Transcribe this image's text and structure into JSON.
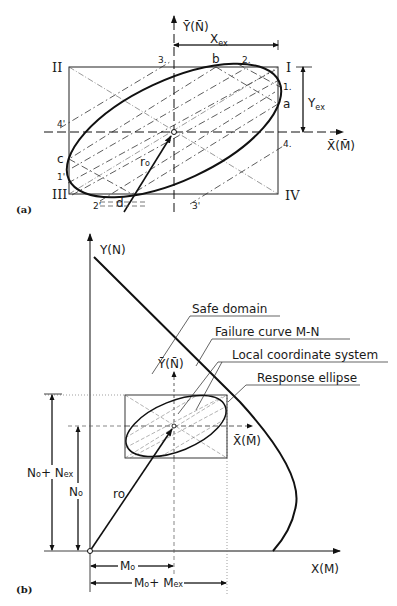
{
  "figure": {
    "panel_a": {
      "label": "(a)",
      "y_axis_label": "Ȳ(N̄)",
      "x_axis_label": "X̄(M̄)",
      "x_extent_label": "X",
      "x_extent_sub": "ex",
      "y_extent_label": "Y",
      "y_extent_sub": "ex",
      "quadrants": [
        "I",
        "II",
        "III",
        "IV"
      ],
      "tangent_points": [
        "a",
        "b",
        "c",
        "d"
      ],
      "tangent_line_labels": [
        "1.",
        "2.",
        "3.",
        "4.",
        "1'",
        "2'",
        "3'",
        "4'"
      ],
      "vector_label": "r",
      "vector_sub": "o"
    },
    "panel_b": {
      "label": "(b)",
      "y_axis_label": "Y(N)",
      "x_axis_label": "X(M)",
      "local_y_label": "Ȳ(N̄)",
      "local_x_label": "X̄(M̄)",
      "callouts": [
        "Safe domain",
        "Failure curve M-N",
        "Local coordinate system",
        "Response ellipse"
      ],
      "vector_label": "r",
      "vector_sub": "o",
      "dim_n0": "N",
      "dim_n0_sub": "o",
      "dim_n0_nex": "N",
      "dim_n0_nex_sub1": "o",
      "dim_n0_nex_mid": "+ N",
      "dim_n0_nex_sub2": "ex",
      "dim_m0": "M",
      "dim_m0_sub": "o",
      "dim_m0_mex": "M",
      "dim_m0_mex_sub1": "o",
      "dim_m0_mex_mid": "+ M",
      "dim_m0_mex_sub2": "ex"
    }
  }
}
